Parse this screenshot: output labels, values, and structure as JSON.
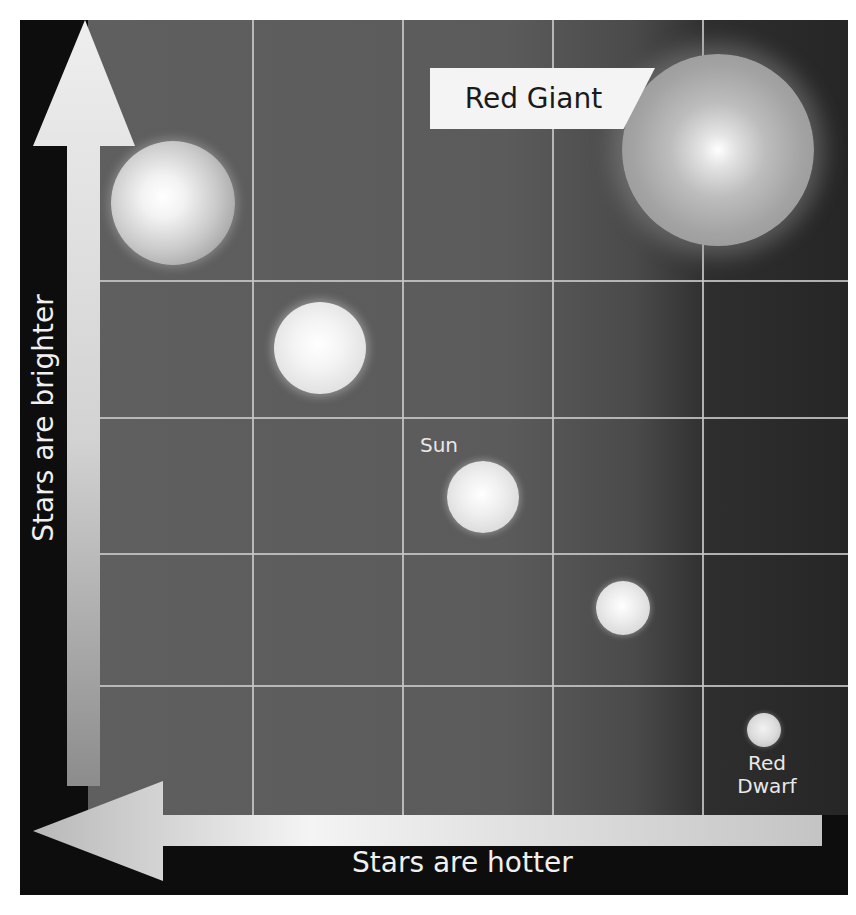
{
  "diagram": {
    "title": "",
    "type": "Hertzsprung-Russell style star comparison grid",
    "grid": {
      "columns": 5,
      "rows": 5
    },
    "axes": {
      "y_label": "Stars are brighter",
      "y_direction": "up",
      "x_label": "Stars are hotter",
      "x_direction": "left"
    },
    "stars": [
      {
        "id": "star-1",
        "label": "",
        "cx": 173,
        "cy": 203,
        "r": 62
      },
      {
        "id": "star-2",
        "label": "",
        "cx": 320,
        "cy": 348,
        "r": 46
      },
      {
        "id": "sun",
        "label": "Sun",
        "cx": 483,
        "cy": 497,
        "r": 36
      },
      {
        "id": "star-4",
        "label": "",
        "cx": 623,
        "cy": 608,
        "r": 27
      },
      {
        "id": "red-dwarf",
        "label_line1": "Red",
        "label_line2": "Dwarf",
        "cx": 764,
        "cy": 730,
        "r": 17
      },
      {
        "id": "red-giant",
        "label": "Red Giant",
        "cx": 718,
        "cy": 150,
        "r": 96
      }
    ],
    "colors": {
      "frame": "#0d0d0d",
      "plot_left": "#5f5f5f",
      "plot_right": "#262626",
      "grid_line": "#c8c8c8",
      "arrow": "#e6e6e6",
      "label_box": "#f4f4f4"
    }
  }
}
